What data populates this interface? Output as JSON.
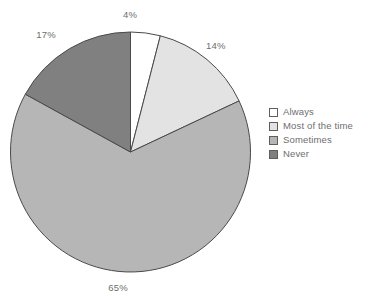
{
  "chart_data": {
    "type": "pie",
    "title": "",
    "subtitle": "",
    "xlabel": "",
    "ylabel": "",
    "legend_position": "right",
    "grid": false,
    "start_angle_deg": 0,
    "direction": "clockwise",
    "categories": [
      "Always",
      "Most of the time",
      "Sometimes",
      "Never"
    ],
    "values": [
      4,
      14,
      65,
      17
    ],
    "value_unit": "%",
    "data_labels": [
      "4%",
      "14%",
      "65%",
      "17%"
    ],
    "slice_colors": [
      "#ffffff",
      "#e3e3e3",
      "#b6b6b6",
      "#808080"
    ],
    "slice_border_color": "#4a4a4a",
    "label_color": "#6e6e6e",
    "slices": [
      {
        "label": "Always",
        "value": 4,
        "display": "4%",
        "color": "#ffffff"
      },
      {
        "label": "Most of the time",
        "value": 14,
        "display": "14%",
        "color": "#e3e3e3"
      },
      {
        "label": "Sometimes",
        "value": 65,
        "display": "65%",
        "color": "#b6b6b6"
      },
      {
        "label": "Never",
        "value": 17,
        "display": "17%",
        "color": "#808080"
      }
    ]
  },
  "labels": {
    "always_pct": "4%",
    "most_pct": "14%",
    "sometimes_pct": "65%",
    "never_pct": "17%"
  },
  "legend": {
    "items": [
      {
        "label": "Always",
        "color": "#ffffff"
      },
      {
        "label": "Most of the time",
        "color": "#e3e3e3"
      },
      {
        "label": "Sometimes",
        "color": "#b6b6b6"
      },
      {
        "label": "Never",
        "color": "#808080"
      }
    ]
  }
}
